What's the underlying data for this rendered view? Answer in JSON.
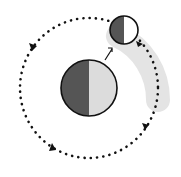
{
  "diagram": {
    "type": "orbit-diagram",
    "elements": [
      {
        "name": "planet",
        "shape": "circle",
        "halves": [
          "dark",
          "light"
        ]
      },
      {
        "name": "moon",
        "shape": "circle",
        "halves": [
          "dark",
          "light"
        ]
      },
      {
        "name": "orbit-path",
        "style": "dotted",
        "direction_arrows": 4
      },
      {
        "name": "pointer-arrow",
        "from": "planet",
        "to": "moon"
      },
      {
        "name": "shaded-swept-band"
      }
    ],
    "colors": {
      "dark_half": "#555555",
      "planet_light_half": "#dcdcdc",
      "moon_light_half": "#ffffff",
      "outline": "#111111",
      "band": "#e4e4e4",
      "dots": "#111111"
    }
  }
}
